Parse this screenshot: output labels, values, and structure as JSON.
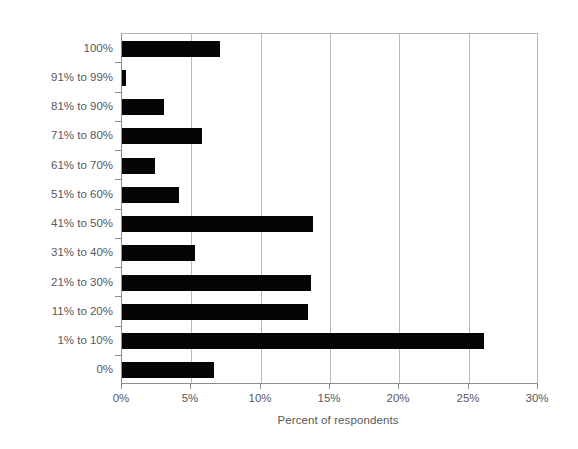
{
  "chart_data": {
    "type": "bar",
    "orientation": "horizontal",
    "title": "",
    "xlabel": "Percent of respondents",
    "ylabel": "",
    "xlim": [
      0,
      30
    ],
    "xticks": [
      "0%",
      "5%",
      "10%",
      "15%",
      "20%",
      "25%",
      "30%"
    ],
    "xtick_values": [
      0,
      5,
      10,
      15,
      20,
      25,
      30
    ],
    "grid": "vertical",
    "legend": "none",
    "bar_color": "#050505",
    "categories": [
      "100%",
      "91% to 99%",
      "81% to 90%",
      "71% to 80%",
      "61% to 70%",
      "51% to 60%",
      "41% to 50%",
      "31% to 40%",
      "21% to 30%",
      "11% to 20%",
      "1% to 10%",
      "0%"
    ],
    "values": [
      7.1,
      0.3,
      3.0,
      5.8,
      2.4,
      4.1,
      13.8,
      5.3,
      13.6,
      13.4,
      26.1,
      6.6
    ]
  },
  "axis": {
    "x_title": "Percent of respondents"
  }
}
